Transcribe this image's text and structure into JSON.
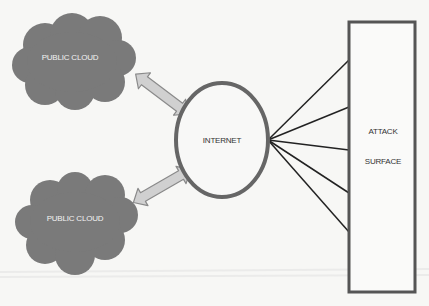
{
  "diagram": {
    "clouds": [
      {
        "label": "PUBLIC CLOUD"
      },
      {
        "label": "PUBLIC CLOUD"
      }
    ],
    "hub": {
      "label": "INTERNET"
    },
    "target": {
      "line1": "ATTACK",
      "line2": "SURFACE"
    },
    "connections": {
      "cloud_to_hub": "bidirectional",
      "hub_to_target_line_count": 5
    },
    "colors": {
      "cloud_fill": "#7a7a7a",
      "arrow_fill": "#d0d0d0",
      "arrow_stroke": "#8a8a8a",
      "circle_stroke": "#666666",
      "rect_stroke": "#555555",
      "line_color": "#222222",
      "background": "#f7f7f5"
    }
  }
}
